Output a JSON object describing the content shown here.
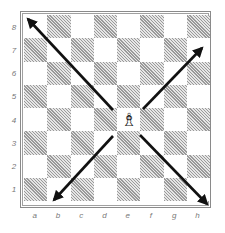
{
  "diagram": {
    "board": {
      "files": [
        "a",
        "b",
        "c",
        "d",
        "e",
        "f",
        "g",
        "h"
      ],
      "ranks": [
        "8",
        "7",
        "6",
        "5",
        "4",
        "3",
        "2",
        "1"
      ],
      "light_color": "#ffffff",
      "dark_color": "#9a9a9a"
    },
    "piece": {
      "type": "bishop",
      "color": "white",
      "square": "e4",
      "glyph": "♗"
    },
    "arrows": [
      {
        "direction": "north-west",
        "from": "e4",
        "to": "a8"
      },
      {
        "direction": "north-east",
        "from": "e4",
        "to": "h7"
      },
      {
        "direction": "south-west",
        "from": "e4",
        "to": "b1"
      },
      {
        "direction": "south-east",
        "from": "e4",
        "to": "h1"
      }
    ],
    "arrow_color": "#111111"
  }
}
